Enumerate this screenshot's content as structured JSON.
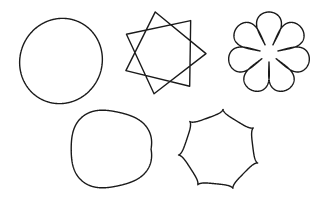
{
  "figure": {
    "background": "#ffffff",
    "stroke_color": "#1a1a1a",
    "shapes": [
      {
        "name": "ellipse",
        "kind": "ellipse",
        "cx": 61,
        "cy": 61,
        "rx": 41,
        "ry": 43,
        "rotate": 25
      },
      {
        "name": "heptagram",
        "kind": "star-polygon",
        "cx": 164,
        "cy": 53,
        "r": 42,
        "points": 7,
        "step": 2,
        "rotate": -12
      },
      {
        "name": "rose-flower",
        "kind": "rose",
        "cx": 269,
        "cy": 53,
        "r": 41,
        "petals": 7,
        "inner": 9
      },
      {
        "name": "wavy-circle",
        "kind": "epicycloid-ring",
        "cx": 110,
        "cy": 149,
        "r": 41,
        "waves": 7,
        "amp": 2.2
      },
      {
        "name": "hypocycloid-star",
        "kind": "hypocycloid",
        "cx": 219,
        "cy": 150,
        "r": 40,
        "cusps": 7
      }
    ]
  }
}
